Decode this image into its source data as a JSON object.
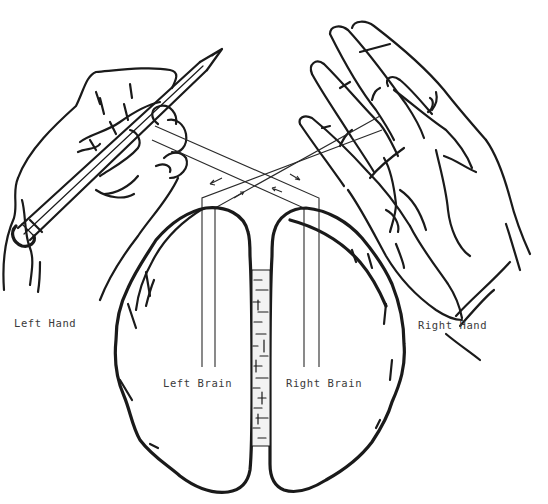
{
  "diagram": {
    "labels": {
      "left_hand": "Left Hand",
      "right_hand": "Right Hand",
      "left_brain": "Left Brain",
      "right_brain": "Right Brain"
    },
    "elements": {
      "left_hand": "hand holding a pencil (upper left)",
      "right_hand": "open hand, palm facing (upper right)",
      "brain": "two hemispheres viewed from above with corpus callosum between",
      "pathways": "paired lines crossing from each hand to the contralateral hemisphere with direction arrows"
    },
    "colors": {
      "ink": "#1a1a1a",
      "label": "#3a3a3a",
      "background": "#ffffff"
    }
  }
}
